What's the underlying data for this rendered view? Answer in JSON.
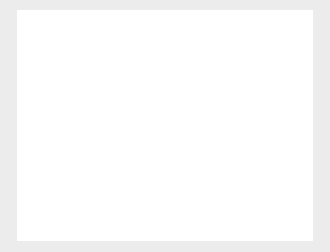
{
  "chart_data": {
    "type": "bar",
    "subtype": "high-low-range",
    "title": "",
    "xlabel": "Date",
    "ylabel": "High price/Low price",
    "ylim": [
      1200,
      1400
    ],
    "yticks": [
      1200,
      1250,
      1300,
      1350,
      1400
    ],
    "yticklabels": [
      "1200",
      "1250",
      "1300",
      "1350",
      "1400"
    ],
    "xticks": [
      "05jan2001",
      "15jan2001",
      "25jan2001",
      "04feb2001",
      "14feb2001",
      "24feb2001"
    ],
    "xlim": [
      "02jan2001",
      "27feb2001"
    ],
    "grid": "horizontal",
    "legend": "none",
    "series": [
      {
        "name": "High price",
        "values": [
          1302,
          1316,
          1349,
          1347,
          1340,
          1314,
          1292,
          1288,
          1301,
          1312,
          1330,
          1331,
          1334,
          1338,
          1355,
          1351,
          1357,
          1349,
          1365,
          1374,
          1372,
          1380,
          1376,
          1368,
          1348,
          1362,
          1358,
          1354,
          1346,
          1359,
          1352,
          1358,
          1340,
          1329,
          1320,
          1301,
          1284
        ]
      },
      {
        "name": "Low price",
        "values": [
          1268,
          1279,
          1319,
          1314,
          1292,
          1284,
          1264,
          1260,
          1272,
          1285,
          1300,
          1302,
          1308,
          1310,
          1325,
          1322,
          1330,
          1323,
          1338,
          1347,
          1346,
          1353,
          1349,
          1343,
          1320,
          1333,
          1329,
          1325,
          1319,
          1330,
          1324,
          1330,
          1310,
          1296,
          1286,
          1262,
          1232
        ]
      }
    ],
    "x_positions": [
      56,
      62,
      68,
      74,
      80,
      86,
      92,
      98,
      104,
      110,
      116,
      122,
      128,
      134,
      140,
      146,
      152,
      158,
      164,
      170,
      176,
      182,
      188,
      194,
      200,
      206,
      212,
      218,
      224,
      230,
      236,
      242,
      248,
      254,
      260,
      266,
      272
    ],
    "colors": {
      "background": "#ececec",
      "panel": "#ffffff",
      "bar": "#8f8f8f",
      "axis": "#9a9a9a",
      "grid": "#ededed",
      "text": "#2b2b2b"
    }
  }
}
